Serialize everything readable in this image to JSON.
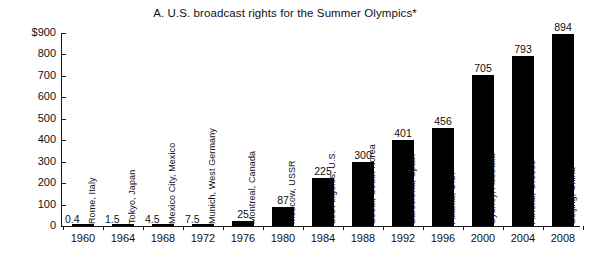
{
  "chart_data": {
    "type": "bar",
    "title": "A.  U.S. broadcast rights for the Summer Olympics*",
    "xlabel": "",
    "ylabel": "",
    "ylim": [
      0,
      900
    ],
    "grid": false,
    "legend": null,
    "y_ticks": [
      "$900",
      "800",
      "700",
      "600",
      "500",
      "400",
      "300",
      "200",
      "100",
      "0"
    ],
    "y_tick_values": [
      900,
      800,
      700,
      600,
      500,
      400,
      300,
      200,
      100,
      0
    ],
    "categories": [
      "1960",
      "1964",
      "1968",
      "1972",
      "1976",
      "1980",
      "1984",
      "1988",
      "1992",
      "1996",
      "2000",
      "2004",
      "2008"
    ],
    "values": [
      0.4,
      1.5,
      4.5,
      7.5,
      25,
      87,
      225,
      300,
      401,
      456,
      705,
      793,
      894
    ],
    "value_labels": [
      "0.4",
      "1.5",
      "4.5",
      "7.5",
      "25",
      "87",
      "225",
      "300",
      "401",
      "456",
      "705",
      "793",
      "894"
    ],
    "annotations": [
      "Rome, Italy",
      "Tokyo, Japan",
      "Mexico City, Mexico",
      "Munich, West Germany",
      "Montreal, Canada",
      "Moscow, USSR",
      "Los Angeles, U.S.",
      "Seoul, South Korea",
      "Barcelona, Spain",
      "Atlanta, U.S.",
      "Sydney, Australia",
      "Athens, Greece",
      "Beijing, China"
    ],
    "bar_color": "#000000",
    "axis_color": "#1a1a1a",
    "background_color": "#ffffff"
  }
}
